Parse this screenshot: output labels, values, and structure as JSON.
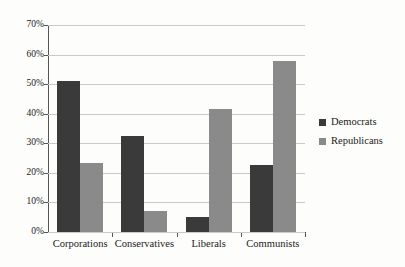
{
  "chart_data": {
    "type": "bar",
    "title": "",
    "xlabel": "",
    "ylabel": "",
    "categories": [
      "Corporations",
      "Conservatives",
      "Liberals",
      "Communists"
    ],
    "series": [
      {
        "name": "Democrats",
        "color": "#3a3a3a",
        "values": [
          51,
          32.5,
          5,
          22.5
        ]
      },
      {
        "name": "Republicans",
        "color": "#8a8a8a",
        "values": [
          23.5,
          7,
          41.5,
          58
        ]
      }
    ],
    "ylim": [
      0,
      70
    ],
    "ytick_values": [
      0,
      10,
      20,
      30,
      40,
      50,
      60,
      70
    ],
    "ytick_labels": [
      "0%",
      "10%",
      "20%",
      "30%",
      "40%",
      "50%",
      "60%",
      "70%"
    ],
    "grid": true,
    "legend_position": "right",
    "value_format": "percent"
  },
  "legend": {
    "entries": [
      {
        "label": "Democrats"
      },
      {
        "label": "Republicans"
      }
    ]
  },
  "caption": {
    "artifact_text": ""
  }
}
